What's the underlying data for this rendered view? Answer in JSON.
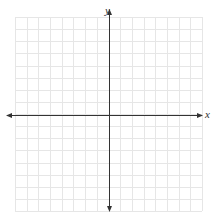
{
  "diagram": {
    "type": "coordinate-plane",
    "x_axis_label": "x",
    "y_axis_label": "y",
    "grid": {
      "left": 15,
      "top": 17,
      "right": 202,
      "bottom": 211,
      "columns": 16,
      "rows": 16,
      "color": "#e6e6e6"
    },
    "axes": {
      "origin_x": 109,
      "origin_y": 115,
      "color": "#333333",
      "x_start": 6,
      "x_end": 203,
      "y_start": 9,
      "y_end": 212
    }
  }
}
